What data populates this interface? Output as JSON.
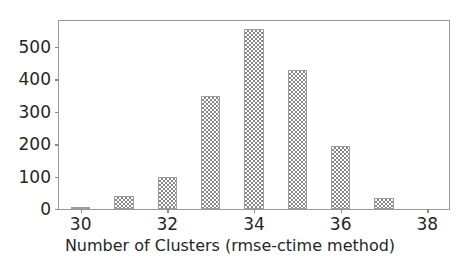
{
  "chart_data": {
    "type": "bar",
    "title": "",
    "xlabel": "Number of Clusters (rmse-ctime method)",
    "ylabel": "",
    "categories": [
      30,
      31,
      32,
      33,
      34,
      35,
      36,
      37
    ],
    "values": [
      4,
      40,
      100,
      350,
      555,
      430,
      193,
      33
    ],
    "xlim": [
      29.5,
      38.5
    ],
    "ylim": [
      0,
      580
    ],
    "xticks": [
      30,
      32,
      34,
      36,
      38
    ],
    "xtick_labels": [
      "30",
      "32",
      "34",
      "36",
      "38"
    ],
    "yticks": [
      0,
      100,
      200,
      300,
      400,
      500
    ],
    "ytick_labels": [
      "0",
      "100",
      "200",
      "300",
      "400",
      "500"
    ],
    "grid": false,
    "legend": null,
    "bar_width": 0.45,
    "bar_color": "#808080",
    "bar_hatch": "checkerboard",
    "axes_color": "#9a9a9a",
    "background": "#ffffff",
    "bars": [
      {
        "x": 30,
        "value": 4,
        "label": "30"
      },
      {
        "x": 31,
        "value": 40,
        "label": "31"
      },
      {
        "x": 32,
        "value": 100,
        "label": "32"
      },
      {
        "x": 33,
        "value": 350,
        "label": "33"
      },
      {
        "x": 34,
        "value": 555,
        "label": "34"
      },
      {
        "x": 35,
        "value": 430,
        "label": "35"
      },
      {
        "x": 36,
        "value": 193,
        "label": "36"
      },
      {
        "x": 37,
        "value": 33,
        "label": "37"
      }
    ]
  }
}
